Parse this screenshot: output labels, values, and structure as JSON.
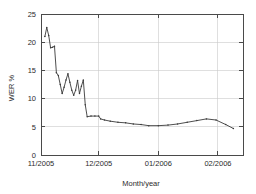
{
  "chart_data": {
    "type": "line",
    "title": "",
    "subtitle": "",
    "xlabel": "Month/year",
    "ylabel": "WER %",
    "ylim": [
      0,
      25
    ],
    "yticks": [
      0,
      5,
      10,
      15,
      20,
      25
    ],
    "ytick_labels": [
      "0",
      "5",
      "10",
      "15",
      "20",
      "25"
    ],
    "xtick_labels": [
      "11/2005",
      "12/2005",
      "01/2006",
      "02/2006"
    ],
    "xtick_positions": [
      0,
      30,
      61,
      92
    ],
    "xlim": [
      0,
      105
    ],
    "grid": true,
    "grid_axis": "y",
    "legend": null,
    "legend_position": "none",
    "line_color": "#3a3a3a",
    "grid_color": "#c9c9c9",
    "axis_color": "#4a4a4a",
    "background": "#ffffff",
    "marker": "point",
    "series": [
      {
        "name": "WER",
        "x": [
          2.0,
          3.0,
          4.0,
          5.0,
          6.0,
          7.0,
          8.0,
          9.0,
          10.0,
          11.0,
          12.0,
          13.0,
          14.0,
          15.0,
          16.0,
          17.0,
          18.0,
          19.0,
          20.0,
          21.0,
          22.0,
          23.0,
          24.0,
          26.0,
          28.0,
          30.0,
          31.0,
          33.0,
          36.0,
          40.0,
          44.0,
          48.0,
          52.0,
          56.0,
          61.0,
          66.0,
          71.0,
          76.0,
          81.0,
          86.0,
          91.0,
          96.0,
          100.0
        ],
        "y": [
          21.0,
          22.6,
          21.2,
          19.0,
          19.1,
          19.3,
          14.6,
          14.1,
          12.5,
          10.9,
          12.0,
          13.3,
          14.4,
          12.9,
          11.5,
          10.6,
          11.5,
          13.2,
          10.9,
          12.2,
          13.3,
          8.9,
          6.8,
          6.9,
          6.9,
          6.9,
          6.4,
          6.2,
          6.0,
          5.8,
          5.7,
          5.5,
          5.4,
          5.2,
          5.2,
          5.3,
          5.5,
          5.8,
          6.1,
          6.4,
          6.2,
          5.4,
          4.7
        ]
      }
    ]
  },
  "axis": {
    "y_label": "WER %",
    "x_label": "Month/year"
  }
}
